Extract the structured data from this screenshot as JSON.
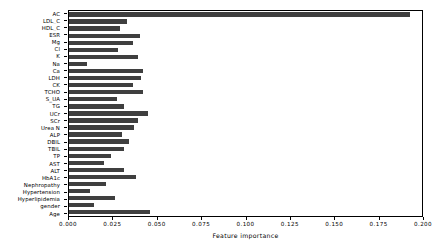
{
  "chart_data": {
    "type": "bar",
    "orientation": "horizontal",
    "title": "",
    "xlabel": "Feature importance",
    "ylabel": "",
    "xlim": [
      0.0,
      0.2
    ],
    "ylim": null,
    "grid": false,
    "legend": null,
    "bar_color": "#3f3f3f",
    "xticks": [
      0.0,
      0.025,
      0.05,
      0.075,
      0.1,
      0.125,
      0.15,
      0.175,
      0.2
    ],
    "xticklabels": [
      "0.000",
      "0.025",
      "0.050",
      "0.075",
      "0.100",
      "0.125",
      "0.150",
      "0.175",
      "0.200"
    ],
    "categories": [
      "AC",
      "LDL_C",
      "HDL_C",
      "ESR",
      "Mg",
      "Cl",
      "K",
      "Na",
      "Ca",
      "LDH",
      "CK",
      "TCHO",
      "S_UA",
      "TG",
      "UCr",
      "SCr",
      "Urea N",
      "ALP",
      "DBIL",
      "TBIL",
      "TP",
      "AST",
      "ALT",
      "HbA1c",
      "Nephropathy",
      "Hypertension",
      "Hyperlipidemia",
      "gender",
      "Age"
    ],
    "values": [
      0.193,
      0.033,
      0.029,
      0.04,
      0.036,
      0.028,
      0.039,
      0.01,
      0.042,
      0.041,
      0.036,
      0.042,
      0.027,
      0.031,
      0.045,
      0.039,
      0.037,
      0.03,
      0.034,
      0.031,
      0.024,
      0.02,
      0.031,
      0.038,
      0.021,
      0.012,
      0.026,
      0.014,
      0.046
    ],
    "series": [
      {
        "name": "Feature importance",
        "values": [
          0.193,
          0.033,
          0.029,
          0.04,
          0.036,
          0.028,
          0.039,
          0.01,
          0.042,
          0.041,
          0.036,
          0.042,
          0.027,
          0.031,
          0.045,
          0.039,
          0.037,
          0.03,
          0.034,
          0.031,
          0.024,
          0.02,
          0.031,
          0.038,
          0.021,
          0.012,
          0.026,
          0.014,
          0.046
        ]
      }
    ]
  }
}
